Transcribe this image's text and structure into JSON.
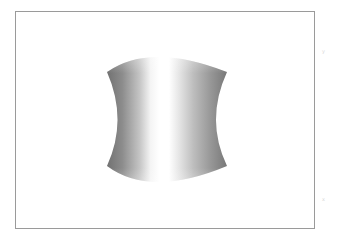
{
  "figure": {
    "shape": "hyperboloid",
    "colors": {
      "background": "#ffffff",
      "frame_border": "#9a9a9a",
      "shade_dark": "#6e6e6e",
      "shade_mid": "#a8a8a8",
      "highlight": "#ffffff"
    }
  },
  "margin_marks": {
    "top_right": "y",
    "bottom_right": "x"
  }
}
